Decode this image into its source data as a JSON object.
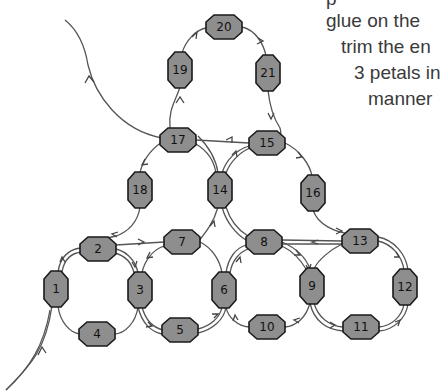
{
  "instructions": {
    "lines": [
      {
        "text": "p",
        "x": 326,
        "y": -12
      },
      {
        "text": "glue on the",
        "x": 326,
        "y": 10
      },
      {
        "text": "trim the en",
        "x": 341,
        "y": 36
      },
      {
        "text": "3 petals in",
        "x": 354,
        "y": 62
      },
      {
        "text": "manner",
        "x": 368,
        "y": 88
      }
    ]
  },
  "diagram": {
    "bead_color": "#8e8e8e",
    "stroke_color": "#1a1a1a",
    "thread_color": "#555555",
    "beads": [
      {
        "id": "1",
        "cx": 56,
        "cy": 289,
        "orient": "v"
      },
      {
        "id": "2",
        "cx": 98,
        "cy": 249,
        "orient": "h"
      },
      {
        "id": "3",
        "cx": 140,
        "cy": 290,
        "orient": "v"
      },
      {
        "id": "4",
        "cx": 97,
        "cy": 334,
        "orient": "h"
      },
      {
        "id": "5",
        "cx": 180,
        "cy": 330,
        "orient": "h"
      },
      {
        "id": "6",
        "cx": 224,
        "cy": 290,
        "orient": "v"
      },
      {
        "id": "7",
        "cx": 182,
        "cy": 242,
        "orient": "h"
      },
      {
        "id": "8",
        "cx": 264,
        "cy": 242,
        "orient": "h"
      },
      {
        "id": "9",
        "cx": 312,
        "cy": 286,
        "orient": "v"
      },
      {
        "id": "10",
        "cx": 267,
        "cy": 327,
        "orient": "h"
      },
      {
        "id": "11",
        "cx": 361,
        "cy": 327,
        "orient": "h"
      },
      {
        "id": "12",
        "cx": 405,
        "cy": 287,
        "orient": "v"
      },
      {
        "id": "13",
        "cx": 360,
        "cy": 241,
        "orient": "h"
      },
      {
        "id": "14",
        "cx": 220,
        "cy": 190,
        "orient": "v"
      },
      {
        "id": "15",
        "cx": 267,
        "cy": 143,
        "orient": "h"
      },
      {
        "id": "16",
        "cx": 313,
        "cy": 193,
        "orient": "v"
      },
      {
        "id": "17",
        "cx": 178,
        "cy": 140,
        "orient": "h"
      },
      {
        "id": "18",
        "cx": 140,
        "cy": 190,
        "orient": "v"
      },
      {
        "id": "19",
        "cx": 180,
        "cy": 70,
        "orient": "v"
      },
      {
        "id": "20",
        "cx": 224,
        "cy": 27,
        "orient": "h"
      },
      {
        "id": "21",
        "cx": 268,
        "cy": 73,
        "orient": "v"
      }
    ]
  }
}
